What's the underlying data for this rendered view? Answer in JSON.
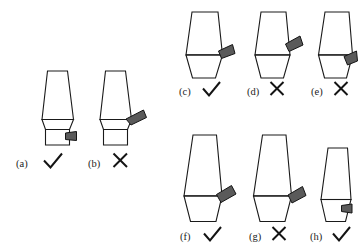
{
  "figure": {
    "title": "",
    "background_color": "#ffffff",
    "outline_color": "#1a1a1a",
    "wedge_color": "#5a5a5a",
    "mark_color": "#141414",
    "panel_count": 8
  },
  "panels": [
    {
      "id": "a",
      "label": "(a)",
      "mark": "check",
      "group": "left",
      "shape": "two-part vessel: tapered upper body over rectangular base",
      "wedge_position": "right side of rectangular base",
      "wedge_angle_deg": 0
    },
    {
      "id": "b",
      "label": "(b)",
      "mark": "cross",
      "group": "left",
      "shape": "two-part vessel: tapered upper body over rectangular base",
      "wedge_position": "right side at shoulder junction line",
      "wedge_angle_deg": -30
    },
    {
      "id": "c",
      "label": "(c)",
      "mark": "check",
      "group": "top-right",
      "shape": "upper trapezoid over inverted lower trapezoid",
      "wedge_position": "right side on junction line",
      "wedge_angle_deg": -20
    },
    {
      "id": "d",
      "label": "(d)",
      "mark": "cross",
      "group": "top-right",
      "shape": "upper trapezoid over inverted lower trapezoid",
      "wedge_position": "right side above junction line",
      "wedge_angle_deg": -28
    },
    {
      "id": "e",
      "label": "(e)",
      "mark": "cross",
      "group": "top-right",
      "shape": "upper trapezoid over inverted lower trapezoid",
      "wedge_position": "right side below junction line",
      "wedge_angle_deg": -32
    },
    {
      "id": "f",
      "label": "(f)",
      "mark": "check",
      "group": "bottom-right",
      "shape": "tall upper trapezoid over inverted lower trapezoid",
      "wedge_position": "right side on junction line",
      "wedge_angle_deg": -26
    },
    {
      "id": "g",
      "label": "(g)",
      "mark": "cross",
      "group": "bottom-right",
      "shape": "tall upper trapezoid over inverted lower trapezoid",
      "wedge_position": "right side on junction line, shifted outward",
      "wedge_angle_deg": -22
    },
    {
      "id": "h",
      "label": "(h)",
      "mark": "check",
      "group": "bottom-right",
      "shape": "small upper trapezoid over inverted lower trapezoid",
      "wedge_position": "right side below junction line",
      "wedge_angle_deg": 0
    }
  ],
  "marks": {
    "check_symbol": "check-mark",
    "cross_symbol": "cross-mark"
  }
}
